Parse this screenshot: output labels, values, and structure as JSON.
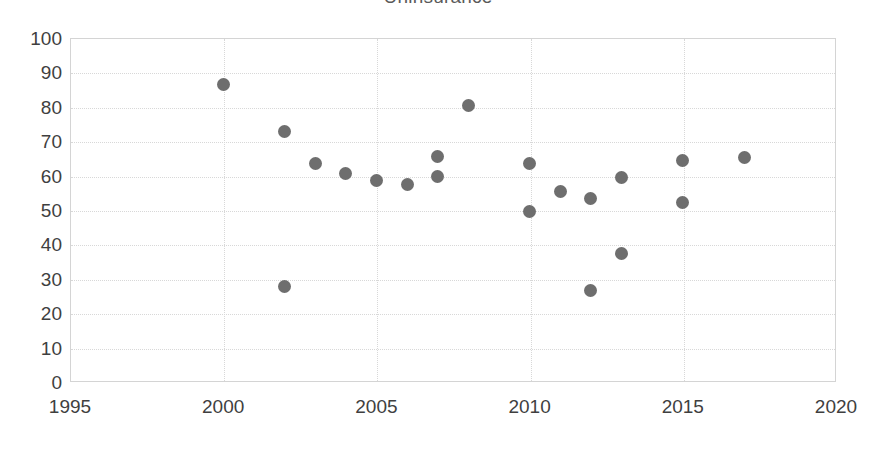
{
  "chart_data": {
    "type": "scatter",
    "title": "Uninsurance",
    "xlabel": "",
    "ylabel": "",
    "xlim": [
      1995,
      2020
    ],
    "ylim": [
      0,
      100
    ],
    "grid": true,
    "legend": "none",
    "marker_color": "#6e6e6e",
    "xticks": [
      "1995",
      "2000",
      "2005",
      "2010",
      "2015",
      "2020"
    ],
    "xtick_values": [
      1995,
      2000,
      2005,
      2010,
      2015,
      2020
    ],
    "yticks": [
      "0",
      "10",
      "20",
      "30",
      "40",
      "50",
      "60",
      "70",
      "80",
      "90",
      "100"
    ],
    "ytick_values": [
      0,
      10,
      20,
      30,
      40,
      50,
      60,
      70,
      80,
      90,
      100
    ],
    "points": [
      {
        "x": 2000,
        "y": 86.5
      },
      {
        "x": 2002,
        "y": 72.7
      },
      {
        "x": 2002,
        "y": 27.8
      },
      {
        "x": 2003,
        "y": 63.5
      },
      {
        "x": 2004,
        "y": 60.7
      },
      {
        "x": 2005,
        "y": 58.7
      },
      {
        "x": 2006,
        "y": 57.5
      },
      {
        "x": 2007,
        "y": 65.5
      },
      {
        "x": 2007,
        "y": 59.6
      },
      {
        "x": 2008,
        "y": 80.4
      },
      {
        "x": 2010,
        "y": 63.5
      },
      {
        "x": 2010,
        "y": 49.6
      },
      {
        "x": 2011,
        "y": 55.4
      },
      {
        "x": 2012,
        "y": 53.4
      },
      {
        "x": 2012,
        "y": 26.5
      },
      {
        "x": 2013,
        "y": 59.5
      },
      {
        "x": 2013,
        "y": 37.5
      },
      {
        "x": 2015,
        "y": 64.4
      },
      {
        "x": 2015,
        "y": 52.3
      },
      {
        "x": 2017,
        "y": 65.4
      }
    ]
  }
}
